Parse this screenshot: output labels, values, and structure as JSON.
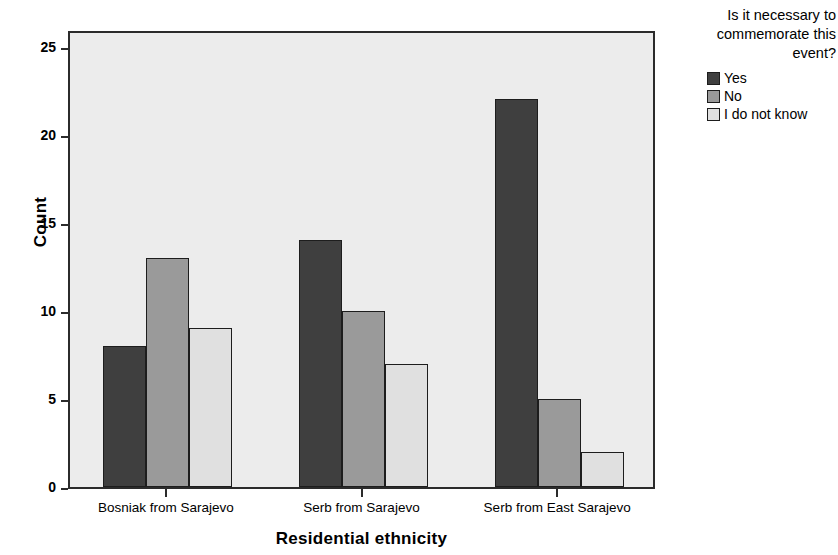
{
  "chart_data": {
    "type": "bar",
    "title": "",
    "xlabel": "Residential ethnicity",
    "ylabel": "Count",
    "categories": [
      "Bosniak from Sarajevo",
      "Serb from Sarajevo",
      "Serb from East Sarajevo"
    ],
    "series": [
      {
        "name": "Yes",
        "values": [
          8,
          14,
          22
        ],
        "color": "#3f3f3f"
      },
      {
        "name": "No",
        "values": [
          13,
          10,
          5
        ],
        "color": "#9a9a9a"
      },
      {
        "name": "I do not know",
        "values": [
          9,
          7,
          2
        ],
        "color": "#e0e0e0"
      }
    ],
    "ylim": [
      0,
      26
    ],
    "yticks": [
      0,
      5,
      10,
      15,
      20,
      25
    ],
    "ytick_labels": [
      "0",
      "5",
      "10",
      "15",
      "20",
      "25"
    ],
    "grid": false,
    "legend_position": "right",
    "legend_title": "Is it necessary to commemorate this event?",
    "plot_background": "#ececec",
    "axis_color": "#2b2b2b"
  },
  "legend": {
    "title_lines": [
      "Is it necessary to",
      "commemorate this",
      "event?"
    ]
  }
}
